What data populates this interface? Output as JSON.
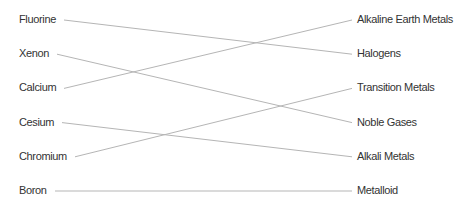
{
  "matching": {
    "left_items": [
      "Fluorine",
      "Xenon",
      "Calcium",
      "Cesium",
      "Chromium",
      "Boron"
    ],
    "right_items": [
      "Alkaline Earth Metals",
      "Halogens",
      "Transition Metals",
      "Noble Gases",
      "Alkali Metals",
      "Metalloid"
    ],
    "connections": [
      {
        "from": "Fluorine",
        "to": "Halogens"
      },
      {
        "from": "Xenon",
        "to": "Noble Gases"
      },
      {
        "from": "Calcium",
        "to": "Alkaline Earth Metals"
      },
      {
        "from": "Cesium",
        "to": "Alkali Metals"
      },
      {
        "from": "Chromium",
        "to": "Transition Metals"
      },
      {
        "from": "Boron",
        "to": "Metalloid"
      }
    ],
    "colors": {
      "line": "#b5b5b5",
      "text": "#333333",
      "background": "#ffffff"
    }
  }
}
